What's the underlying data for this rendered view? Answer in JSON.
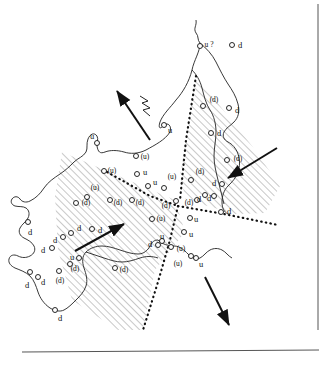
{
  "figure": {
    "kind": "map",
    "background_color": "#ffffff",
    "ink_color": "#111111",
    "hatch_color": "#9a9a9a",
    "border": {
      "right": true,
      "bottom": true,
      "color": "#555555"
    }
  },
  "legend_symbols": {
    "station_circle": "open-circle",
    "up_polarity": "u",
    "down_polarity": "d",
    "uncertain_up": "(u)",
    "uncertain_down": "(d)",
    "queried_up": "u ?"
  },
  "arrows": [
    {
      "name": "northwest-arrow",
      "label": "",
      "x1": 150,
      "y1": 140,
      "x2": 117,
      "y2": 91
    },
    {
      "name": "northeast-arrow",
      "label": "",
      "x1": 75,
      "y1": 251,
      "x2": 124,
      "y2": 224
    },
    {
      "name": "southwest-arrow",
      "label": "",
      "x1": 277,
      "y1": 148,
      "x2": 228,
      "y2": 178
    },
    {
      "name": "southeast-arrow",
      "label": "",
      "x1": 205,
      "y1": 277,
      "x2": 229,
      "y2": 325
    }
  ],
  "zigzag_symbol": {
    "name": "zigzag-icon",
    "x": 143,
    "y": 105
  },
  "points": [
    {
      "t": "u ?",
      "x": 209,
      "y": 45,
      "c": true,
      "cx": 200,
      "cy": 46
    },
    {
      "t": "d",
      "x": 240,
      "y": 45,
      "c": true,
      "cx": 232,
      "cy": 45
    },
    {
      "t": "(d)",
      "x": 214,
      "y": 100,
      "c": true,
      "cx": 203,
      "cy": 106
    },
    {
      "t": "d",
      "x": 237,
      "y": 110,
      "c": true,
      "cx": 229,
      "cy": 108
    },
    {
      "t": "d",
      "x": 219,
      "y": 133,
      "c": true,
      "cx": 211,
      "cy": 133
    },
    {
      "t": "(d)",
      "x": 238,
      "y": 159,
      "c": true,
      "cx": 227,
      "cy": 160
    },
    {
      "t": "(d)",
      "x": 200,
      "y": 172,
      "c": true,
      "cx": 191,
      "cy": 180
    },
    {
      "t": "(d)",
      "x": 189,
      "y": 203,
      "c": true,
      "cx": 197,
      "cy": 200
    },
    {
      "t": "d",
      "x": 214,
      "y": 183,
      "c": true,
      "cx": 222,
      "cy": 184
    },
    {
      "t": "d",
      "x": 199,
      "y": 199,
      "c": true,
      "cx": 205,
      "cy": 195
    },
    {
      "t": "d",
      "x": 209,
      "y": 198,
      "c": true,
      "cx": 214,
      "cy": 196
    },
    {
      "t": "d",
      "x": 229,
      "y": 211,
      "c": true,
      "cx": 221,
      "cy": 212
    },
    {
      "t": "u",
      "x": 170,
      "y": 130,
      "c": true,
      "cx": 164,
      "cy": 125
    },
    {
      "t": "u",
      "x": 92,
      "y": 136,
      "c": true,
      "cx": 97,
      "cy": 143
    },
    {
      "t": "(u)",
      "x": 145,
      "y": 157,
      "c": true,
      "cx": 136,
      "cy": 156
    },
    {
      "t": "(u)",
      "x": 112,
      "y": 171,
      "c": true,
      "cx": 104,
      "cy": 171
    },
    {
      "t": "u",
      "x": 145,
      "y": 172,
      "c": true,
      "cx": 137,
      "cy": 174
    },
    {
      "t": "(u)",
      "x": 172,
      "y": 177,
      "c": true,
      "cx": 164,
      "cy": 188
    },
    {
      "t": "u",
      "x": 155,
      "y": 182,
      "c": true,
      "cx": 148,
      "cy": 186
    },
    {
      "t": "(u)",
      "x": 95,
      "y": 188,
      "c": true,
      "cx": 87,
      "cy": 197
    },
    {
      "t": "(d)",
      "x": 86,
      "y": 203,
      "c": true,
      "cx": 76,
      "cy": 203
    },
    {
      "t": "(d)",
      "x": 118,
      "y": 203,
      "c": true,
      "cx": 110,
      "cy": 200
    },
    {
      "t": "(d)",
      "x": 140,
      "y": 203,
      "c": true,
      "cx": 132,
      "cy": 200
    },
    {
      "t": "(d)",
      "x": 166,
      "y": 206,
      "c": true,
      "cx": 176,
      "cy": 201
    },
    {
      "t": "(u)",
      "x": 161,
      "y": 219,
      "c": true,
      "cx": 152,
      "cy": 219
    },
    {
      "t": "u",
      "x": 196,
      "y": 219,
      "c": true,
      "cx": 190,
      "cy": 218
    },
    {
      "t": "u",
      "x": 191,
      "y": 234,
      "c": true,
      "cx": 184,
      "cy": 232
    },
    {
      "t": "u",
      "x": 162,
      "y": 236,
      "c": true,
      "cx": 162,
      "cy": 241
    },
    {
      "t": "d",
      "x": 150,
      "y": 244,
      "c": true,
      "cx": 158,
      "cy": 245
    },
    {
      "t": "(u)",
      "x": 181,
      "y": 249,
      "c": true,
      "cx": 171,
      "cy": 247
    },
    {
      "t": "(u)",
      "x": 178,
      "y": 264,
      "c": true,
      "cx": 191,
      "cy": 256
    },
    {
      "t": "u",
      "x": 201,
      "y": 264,
      "c": true,
      "cx": 196,
      "cy": 258
    },
    {
      "t": "d",
      "x": 30,
      "y": 232,
      "c": true,
      "cx": 28,
      "cy": 222
    },
    {
      "t": "d",
      "x": 79,
      "y": 228,
      "c": true,
      "cx": 71,
      "cy": 233
    },
    {
      "t": "d",
      "x": 100,
      "y": 230,
      "c": true,
      "cx": 92,
      "cy": 229
    },
    {
      "t": "d",
      "x": 55,
      "y": 240,
      "c": true,
      "cx": 63,
      "cy": 237
    },
    {
      "t": "d",
      "x": 43,
      "y": 250,
      "c": true,
      "cx": 52,
      "cy": 248
    },
    {
      "t": "u",
      "x": 72,
      "y": 257,
      "c": true,
      "cx": 79,
      "cy": 258
    },
    {
      "t": "(d)",
      "x": 75,
      "y": 269,
      "c": true,
      "cx": 70,
      "cy": 264
    },
    {
      "t": "(d)",
      "x": 124,
      "y": 270,
      "c": true,
      "cx": 115,
      "cy": 268
    },
    {
      "t": "d",
      "x": 27,
      "y": 285,
      "c": true,
      "cx": 30,
      "cy": 272
    },
    {
      "t": "d",
      "x": 43,
      "y": 282,
      "c": true,
      "cx": 38,
      "cy": 277
    },
    {
      "t": "(d)",
      "x": 60,
      "y": 281,
      "c": true,
      "cx": 59,
      "cy": 271
    },
    {
      "t": "d",
      "x": 60,
      "y": 318,
      "c": true,
      "cx": 55,
      "cy": 310
    }
  ]
}
